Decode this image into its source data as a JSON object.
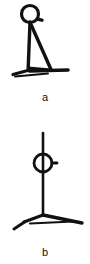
{
  "document": {
    "kind": "line-drawing-figure",
    "background_color": "#ffffff",
    "ink_color": "#111111",
    "caption_font_size_px": 11
  },
  "figures": [
    {
      "id": "a",
      "caption": "a",
      "description": "Side view of a stand: circular head with small right-hand tab on a vertical post, diagonal brace to the base, and a splayed foot",
      "stroke_color": "#111111",
      "parts": {
        "head": {
          "shape": "circle",
          "center_x": 30,
          "center_y": 14,
          "radius": 8.5,
          "stroke_width": 3.2,
          "tab": {
            "shape": "line",
            "x1": 37,
            "y1": 19,
            "x2": 42,
            "y2": 20,
            "stroke_width": 3.4
          }
        },
        "post": {
          "shape": "line",
          "x1": 30,
          "y1": 22,
          "x2": 28,
          "y2": 68,
          "stroke_width": 3.4
        },
        "brace": {
          "shape": "line",
          "x1": 31,
          "y1": 25,
          "x2": 51,
          "y2": 70,
          "stroke_width": 3.4
        },
        "cross_tie": {
          "shape": "line",
          "x1": 28,
          "y1": 68,
          "x2": 50,
          "y2": 70,
          "stroke_width": 3.2
        },
        "foot_left": {
          "shape": "line",
          "x1": 13,
          "y1": 74,
          "x2": 30,
          "y2": 70,
          "stroke_width": 3.2
        },
        "foot_right": {
          "shape": "line",
          "x1": 30,
          "y1": 71,
          "x2": 68,
          "y2": 70,
          "stroke_width": 3.4
        },
        "foot_shadow": {
          "shape": "line",
          "x1": 15,
          "y1": 76,
          "x2": 48,
          "y2": 73,
          "stroke_width": 2.0
        }
      }
    },
    {
      "id": "b",
      "caption": "b",
      "description": "Front view of the same stand: circular ring pierced by a long vertical post with a small right-hand tab, resting on a three-legged splayed base",
      "stroke_color": "#111111",
      "parts": {
        "post": {
          "shape": "line",
          "x1": 43,
          "y1": 3,
          "x2": 43,
          "y2": 85,
          "stroke_width": 2.6
        },
        "ring": {
          "shape": "circle",
          "center_x": 43,
          "center_y": 33,
          "radius": 9,
          "stroke_width": 2.8
        },
        "tab": {
          "shape": "line",
          "x1": 52,
          "y1": 33,
          "x2": 57,
          "y2": 33,
          "stroke_width": 2.8
        },
        "base_left_leg": {
          "shape": "line",
          "x1": 43,
          "y1": 85,
          "x2": 24,
          "y2": 92,
          "stroke_width": 3.0
        },
        "base_right_leg": {
          "shape": "line",
          "x1": 43,
          "y1": 85,
          "x2": 82,
          "y2": 93,
          "stroke_width": 3.2
        },
        "base_front_leg": {
          "shape": "line",
          "x1": 24,
          "y1": 92,
          "x2": 14,
          "y2": 99,
          "stroke_width": 3.0
        },
        "base_brace": {
          "shape": "line",
          "x1": 30,
          "y1": 93,
          "x2": 73,
          "y2": 91,
          "stroke_width": 2.2
        }
      }
    }
  ]
}
